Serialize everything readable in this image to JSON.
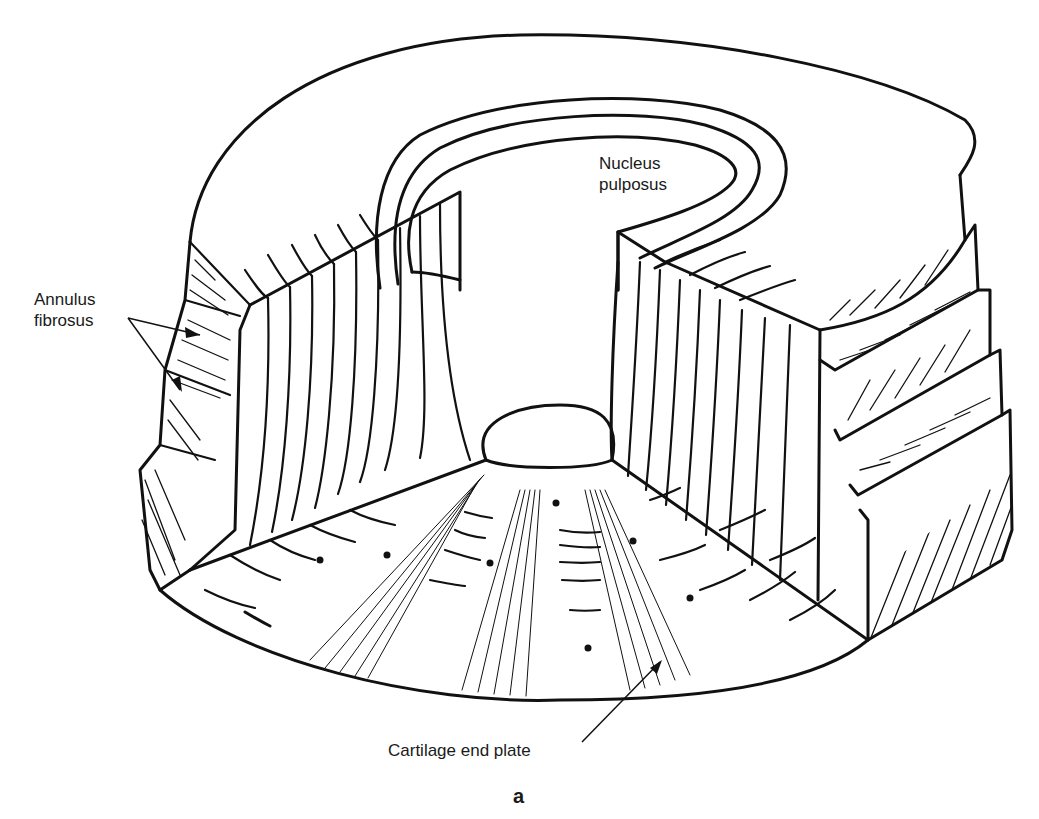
{
  "figure": {
    "panel_label": "a",
    "labels": {
      "nucleus": "Nucleus\npulposus",
      "annulus": "Annulus\nfibrosus",
      "cartilage": "Cartilage end plate"
    },
    "colors": {
      "ink": "#111111",
      "paper": "#ffffff"
    }
  }
}
